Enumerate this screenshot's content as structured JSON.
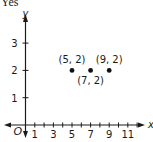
{
  "caption": "Yes",
  "chart_data": {
    "type": "scatter",
    "title": "",
    "xlabel": "x",
    "ylabel": "y",
    "origin_label": "O",
    "xlim": [
      -1,
      12
    ],
    "ylim": [
      -0.3,
      3.8
    ],
    "x_ticks": [
      1,
      2,
      3,
      4,
      5,
      6,
      7,
      8,
      9,
      10,
      11,
      12
    ],
    "x_tick_labels": [
      "1",
      "3",
      "5",
      "7",
      "9",
      "11"
    ],
    "x_tick_label_values": [
      1,
      3,
      5,
      7,
      9,
      11
    ],
    "y_ticks": [
      1,
      2,
      3
    ],
    "y_tick_labels": [
      "1",
      "2",
      "3"
    ],
    "grid": false,
    "legend": null,
    "series": [
      {
        "name": "points",
        "points": [
          {
            "x": 5,
            "y": 2,
            "label": "(5, 2)"
          },
          {
            "x": 7,
            "y": 2,
            "label": "(7, 2)"
          },
          {
            "x": 9,
            "y": 2,
            "label": "(9, 2)"
          }
        ]
      }
    ],
    "colors": {
      "axis": "#1a1a1a",
      "points": "#111111"
    }
  }
}
